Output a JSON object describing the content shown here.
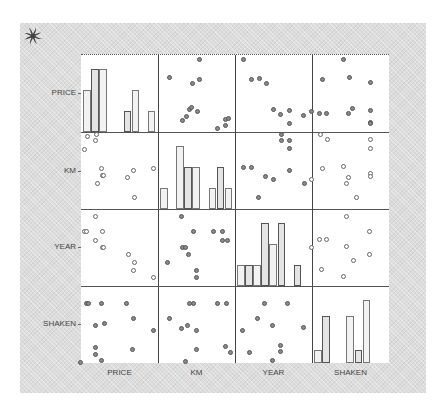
{
  "chart_data": {
    "type": "scatter_matrix",
    "title": "",
    "variables": [
      "PRICE",
      "KM",
      "YEAR",
      "SHAKEN"
    ],
    "diagonal": "histogram",
    "grid": false,
    "legend": null,
    "histograms": {
      "PRICE": {
        "bins": 9,
        "relative_heights": [
          0.67,
          1.0,
          1.0,
          0,
          0,
          0.33,
          0.67,
          0,
          0.33
        ]
      },
      "KM": {
        "bins": 9,
        "relative_heights": [
          0.33,
          0,
          1.0,
          0.67,
          0.67,
          0,
          0.33,
          0.67,
          0.33
        ]
      },
      "YEAR": {
        "bins": 9,
        "relative_heights": [
          0.33,
          0.33,
          0.33,
          1.0,
          0.67,
          1.0,
          0,
          0.33,
          0
        ]
      },
      "SHAKEN": {
        "bins": 9,
        "relative_heights": [
          0.2,
          0.75,
          0,
          0,
          0.75,
          0.2,
          1.0,
          0,
          0
        ]
      }
    },
    "cells": [
      {
        "row": "PRICE",
        "col": "KM",
        "style": "filled",
        "points": [
          [
            0.16,
            0.3
          ],
          [
            0.55,
            0.06
          ],
          [
            0.46,
            0.38
          ],
          [
            0.54,
            0.32
          ],
          [
            0.38,
            0.8
          ],
          [
            0.42,
            0.72
          ],
          [
            0.44,
            0.69
          ],
          [
            0.52,
            0.74
          ],
          [
            0.33,
            0.86
          ],
          [
            0.78,
            0.96
          ],
          [
            0.88,
            0.92
          ],
          [
            0.88,
            0.84
          ],
          [
            0.92,
            0.83
          ]
        ]
      },
      {
        "row": "PRICE",
        "col": "YEAR",
        "style": "filled",
        "points": [
          [
            0.12,
            0.06
          ],
          [
            0.22,
            0.32
          ],
          [
            0.32,
            0.31
          ],
          [
            0.41,
            0.38
          ],
          [
            0.51,
            0.72
          ],
          [
            0.6,
            0.78
          ],
          [
            0.71,
            0.73
          ],
          [
            0.71,
            0.9
          ],
          [
            0.89,
            0.79
          ]
        ]
      },
      {
        "row": "PRICE",
        "col": "SHAKEN",
        "style": "filled",
        "points": [
          [
            0.0,
            0.74
          ],
          [
            0.14,
            0.32
          ],
          [
            0.11,
            0.77
          ],
          [
            0.2,
            0.77
          ],
          [
            0.42,
            0.06
          ],
          [
            0.49,
            0.3
          ],
          [
            0.48,
            0.77
          ],
          [
            0.53,
            0.7
          ],
          [
            0.76,
            0.37
          ],
          [
            0.76,
            0.73
          ],
          [
            0.76,
            0.88
          ],
          [
            0.76,
            0.9
          ]
        ]
      },
      {
        "row": "KM",
        "col": "PRICE",
        "style": "hollow",
        "points": [
          [
            0.09,
            0.06
          ],
          [
            0.21,
            0.04
          ],
          [
            0.2,
            0.12
          ],
          [
            0.05,
            0.24
          ],
          [
            0.27,
            0.48
          ],
          [
            0.28,
            0.57
          ],
          [
            0.3,
            0.57
          ],
          [
            0.22,
            0.67
          ],
          [
            0.61,
            0.6
          ],
          [
            0.69,
            0.5
          ],
          [
            0.95,
            0.48
          ],
          [
            0.7,
            0.86
          ]
        ]
      },
      {
        "row": "KM",
        "col": "YEAR",
        "style": "filled",
        "points": [
          [
            0.12,
            0.47
          ],
          [
            0.22,
            0.47
          ],
          [
            0.4,
            0.58
          ],
          [
            0.51,
            0.62
          ],
          [
            0.31,
            0.86
          ],
          [
            0.61,
            0.04
          ],
          [
            0.61,
            0.12
          ],
          [
            0.71,
            0.12
          ],
          [
            0.71,
            0.22
          ],
          [
            0.71,
            0.51
          ],
          [
            0.91,
            0.68
          ]
        ]
      },
      {
        "row": "KM",
        "col": "SHAKEN",
        "style": "hollow",
        "points": [
          [
            0.0,
            0.62
          ],
          [
            0.12,
            0.04
          ],
          [
            0.21,
            0.1
          ],
          [
            0.14,
            0.48
          ],
          [
            0.42,
            0.46
          ],
          [
            0.48,
            0.6
          ],
          [
            0.45,
            0.68
          ],
          [
            0.58,
            0.86
          ],
          [
            0.76,
            0.1
          ],
          [
            0.76,
            0.22
          ],
          [
            0.76,
            0.54
          ],
          [
            0.76,
            0.59
          ]
        ]
      },
      {
        "row": "YEAR",
        "col": "PRICE",
        "style": "hollow",
        "points": [
          [
            0.2,
            0.1
          ],
          [
            0.05,
            0.3
          ],
          [
            0.08,
            0.3
          ],
          [
            0.28,
            0.3
          ],
          [
            0.19,
            0.41
          ],
          [
            0.28,
            0.51
          ],
          [
            0.3,
            0.51
          ],
          [
            0.62,
            0.6
          ],
          [
            0.7,
            0.7
          ],
          [
            0.69,
            0.8
          ],
          [
            0.95,
            0.9
          ]
        ]
      },
      {
        "row": "YEAR",
        "col": "KM",
        "style": "filled",
        "points": [
          [
            0.31,
            0.1
          ],
          [
            0.47,
            0.3
          ],
          [
            0.33,
            0.51
          ],
          [
            0.36,
            0.51
          ],
          [
            0.4,
            0.6
          ],
          [
            0.13,
            0.7
          ],
          [
            0.5,
            0.81
          ],
          [
            0.51,
            0.9
          ],
          [
            0.73,
            0.3
          ],
          [
            0.85,
            0.3
          ],
          [
            0.85,
            0.41
          ],
          [
            0.91,
            0.41
          ]
        ]
      },
      {
        "row": "YEAR",
        "col": "SHAKEN",
        "style": "hollow",
        "points": [
          [
            0.0,
            0.5
          ],
          [
            0.11,
            0.4
          ],
          [
            0.2,
            0.4
          ],
          [
            0.13,
            0.79
          ],
          [
            0.45,
            0.1
          ],
          [
            0.46,
            0.49
          ],
          [
            0.54,
            0.68
          ],
          [
            0.42,
            0.88
          ],
          [
            0.75,
            0.3
          ],
          [
            0.75,
            0.6
          ]
        ]
      },
      {
        "row": "SHAKEN",
        "col": "PRICE",
        "style": "filled",
        "points": [
          [
            0.08,
            0.24
          ],
          [
            0.1,
            0.24
          ],
          [
            0.27,
            0.24
          ],
          [
            0.6,
            0.24
          ],
          [
            0.69,
            0.43
          ],
          [
            0.2,
            0.52
          ],
          [
            0.31,
            0.49
          ],
          [
            0.95,
            0.58
          ],
          [
            0.19,
            0.8
          ],
          [
            0.2,
            0.89
          ],
          [
            0.27,
            0.98
          ],
          [
            0.68,
            0.83
          ],
          [
            0.0,
            1.0
          ]
        ]
      },
      {
        "row": "SHAKEN",
        "col": "KM",
        "style": "filled",
        "points": [
          [
            0.41,
            0.24
          ],
          [
            0.47,
            0.24
          ],
          [
            0.78,
            0.24
          ],
          [
            0.89,
            0.24
          ],
          [
            0.15,
            0.43
          ],
          [
            0.31,
            0.56
          ],
          [
            0.39,
            0.52
          ],
          [
            0.51,
            0.58
          ],
          [
            0.51,
            0.83
          ],
          [
            0.88,
            0.79
          ],
          [
            0.95,
            0.87
          ],
          [
            0.36,
            0.99
          ]
        ]
      },
      {
        "row": "SHAKEN",
        "col": "YEAR",
        "style": "filled",
        "points": [
          [
            0.39,
            0.24
          ],
          [
            0.69,
            0.24
          ],
          [
            0.3,
            0.43
          ],
          [
            0.49,
            0.52
          ],
          [
            0.1,
            0.58
          ],
          [
            0.89,
            0.55
          ],
          [
            0.2,
            0.87
          ],
          [
            0.6,
            0.78
          ],
          [
            0.6,
            0.86
          ],
          [
            0.49,
            0.97
          ]
        ]
      }
    ]
  },
  "labels": {
    "rows": [
      "PRICE",
      "KM",
      "YEAR",
      "SHAKEN"
    ],
    "cols": [
      "PRICE",
      "KM",
      "YEAR",
      "SHAKEN"
    ]
  },
  "icons": {
    "logo": "swirl-logo-icon"
  }
}
